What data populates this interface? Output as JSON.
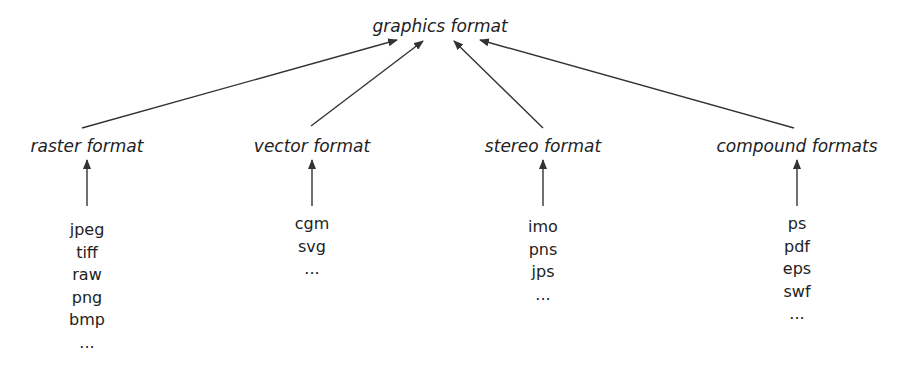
{
  "root": {
    "label": "graphics format"
  },
  "categories": [
    {
      "label": "raster format",
      "items": [
        "jpeg",
        "tiff",
        "raw",
        "png",
        "bmp",
        "..."
      ]
    },
    {
      "label": "vector format",
      "items": [
        "cgm",
        "svg",
        "..."
      ]
    },
    {
      "label": "stereo format",
      "items": [
        "imo",
        "pns",
        "jps",
        "..."
      ]
    },
    {
      "label": "compound formats",
      "items": [
        "ps",
        "pdf",
        "eps",
        "swf",
        "..."
      ]
    }
  ],
  "colors": {
    "line": "#333333",
    "text": "#222222",
    "background": "#ffffff"
  }
}
